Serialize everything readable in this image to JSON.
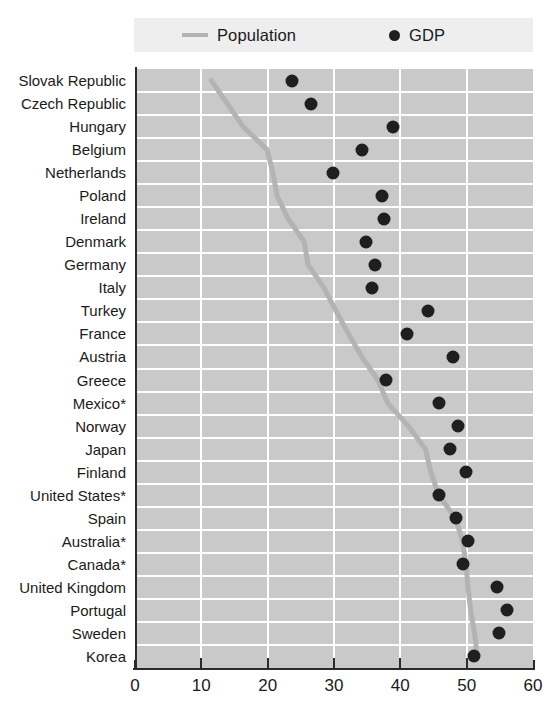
{
  "legend": {
    "population": {
      "label": "Population",
      "icon": "line-swatch-icon",
      "color": "#b3b3b3"
    },
    "gdp": {
      "label": "GDP",
      "icon": "dot-swatch-icon",
      "color": "#1f1f1f"
    }
  },
  "axis": {
    "x_ticks": [
      "0",
      "10",
      "20",
      "30",
      "40",
      "50",
      "60"
    ],
    "x_min": 0,
    "x_max": 60,
    "x_step": 10
  },
  "chart_data": {
    "type": "scatter",
    "title": "",
    "subtitle": "",
    "xlabel": "",
    "ylabel": "",
    "xlim": [
      0,
      60
    ],
    "grid": true,
    "legend_position": "top",
    "orientation": "horizontal",
    "categories": [
      "Slovak Republic",
      "Czech Republic",
      "Hungary",
      "Belgium",
      "Netherlands",
      "Poland",
      "Ireland",
      "Denmark",
      "Germany",
      "Italy",
      "Turkey",
      "France",
      "Austria",
      "Greece",
      "Mexico*",
      "Norway",
      "Japan",
      "Finland",
      "United States*",
      "Spain",
      "Australia*",
      "Canada*",
      "United Kingdom",
      "Portugal",
      "Sweden",
      "Korea"
    ],
    "series": [
      {
        "name": "Population",
        "type": "line",
        "color": "#b3b3b3",
        "values": [
          11.5,
          13.9,
          16.3,
          19.9,
          20.8,
          21.4,
          23.1,
          25.5,
          26.1,
          28.5,
          30.3,
          32.2,
          34.2,
          36.6,
          38.1,
          41.2,
          43.8,
          44.6,
          45.8,
          48.3,
          49.4,
          49.9,
          50.2,
          50.6,
          51.2,
          51.6
        ]
      },
      {
        "name": "GDP",
        "type": "scatter",
        "color": "#1f1f1f",
        "values": [
          23.7,
          26.6,
          38.9,
          34.2,
          29.9,
          37.2,
          37.6,
          34.8,
          36.2,
          35.7,
          44.1,
          41.0,
          47.9,
          37.9,
          45.9,
          48.7,
          47.5,
          49.9,
          45.9,
          48.4,
          50.2,
          49.5,
          54.6,
          56.1,
          54.9,
          51.1
        ]
      }
    ]
  }
}
